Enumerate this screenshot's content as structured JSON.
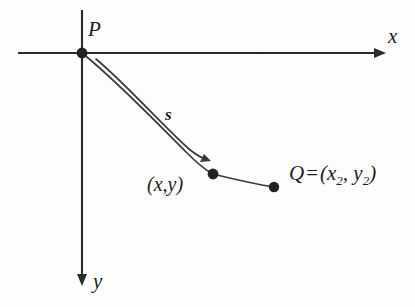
{
  "figure": {
    "background_color": "#fdfdfd",
    "ink_color": "#2b2b2b",
    "width": 415,
    "height": 307
  },
  "axes": {
    "x_label": "x",
    "y_label": "y",
    "x_axis_name": "horizontal-axis",
    "y_axis_name": "vertical-axis",
    "origin": {
      "x": 82,
      "y": 53
    },
    "x_axis": {
      "start_x": 18,
      "end_x": 386,
      "y": 53,
      "arrow": "right"
    },
    "y_axis": {
      "x": 82,
      "start_y": 10,
      "end_y": 285,
      "arrow": "down"
    }
  },
  "points": [
    {
      "id": "P",
      "label": "P",
      "x": 82,
      "y": 53,
      "name": "point-p"
    },
    {
      "id": "XY",
      "label": "(x,y)",
      "x": 213,
      "y": 174,
      "name": "point-xy"
    },
    {
      "id": "Q",
      "label": "Q",
      "x": 274,
      "y": 187,
      "name": "point-q"
    }
  ],
  "labels": {
    "p": "P",
    "xy": "(x,y)",
    "s": "s",
    "q_name": "Q",
    "q_equals": "=",
    "q_open": "(",
    "q_x": "x",
    "q_x_sub": "2",
    "q_comma": ",",
    "q_y": "y",
    "q_y_sub": "2",
    "q_close": ")",
    "axis_x": "x",
    "axis_y": "y"
  },
  "curve": {
    "name": "path-curve",
    "arc_label": "s",
    "description": "descending concave curve from P through (x,y) to Q",
    "outer_path": "M 82 53 C 118 82, 160 126, 186 152 C 198 164, 205 170, 213 174 C 233 179, 254 184, 274 187",
    "inner_path": "M 96 59 C 128 86, 164 127, 190 150 C 197 155, 202 158, 207 160",
    "arrow_tip": {
      "x": 210,
      "y": 161
    }
  }
}
